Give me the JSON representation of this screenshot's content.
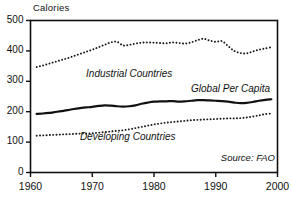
{
  "chart_data": {
    "type": "line",
    "title": "",
    "subtitle": "",
    "xlabel": "",
    "ylabel": "Calories",
    "xlim": [
      1960,
      2000
    ],
    "ylim": [
      0,
      500
    ],
    "grid": false,
    "legend_position": "inline-annotations",
    "source_note": "Source: FAO",
    "x_ticks": [
      "1960",
      "1970",
      "1980",
      "1990",
      "2000"
    ],
    "x_tick_values": [
      1960,
      1970,
      1980,
      1990,
      2000
    ],
    "y_ticks": [
      "0",
      "100",
      "200",
      "300",
      "400",
      "500"
    ],
    "y_tick_values": [
      0,
      100,
      200,
      300,
      400,
      500
    ],
    "x": [
      1961,
      1962,
      1963,
      1964,
      1965,
      1966,
      1967,
      1968,
      1969,
      1970,
      1971,
      1972,
      1973,
      1974,
      1975,
      1976,
      1977,
      1978,
      1979,
      1980,
      1981,
      1982,
      1983,
      1984,
      1985,
      1986,
      1987,
      1988,
      1989,
      1990,
      1991,
      1992,
      1993,
      1994,
      1995,
      1996,
      1997,
      1998,
      1999
    ],
    "series": [
      {
        "name": "Industrial Countries",
        "style": "dotted",
        "color": "#1a1a1a",
        "label_x": 1969,
        "label_y": 322,
        "values": [
          347,
          352,
          358,
          364,
          370,
          376,
          383,
          390,
          397,
          404,
          412,
          420,
          428,
          430,
          418,
          420,
          424,
          427,
          428,
          427,
          426,
          425,
          428,
          426,
          424,
          428,
          435,
          440,
          434,
          430,
          432,
          416,
          400,
          393,
          392,
          398,
          404,
          408,
          412
        ]
      },
      {
        "name": "Global Per Capita",
        "style": "solid",
        "color": "#111111",
        "label_x": 1986,
        "label_y": 272,
        "values": [
          193,
          194,
          196,
          199,
          202,
          205,
          209,
          212,
          214,
          216,
          219,
          221,
          220,
          218,
          217,
          218,
          221,
          226,
          230,
          233,
          234,
          234,
          235,
          233,
          234,
          236,
          238,
          238,
          237,
          236,
          235,
          233,
          230,
          228,
          229,
          232,
          236,
          239,
          241
        ]
      },
      {
        "name": "Developing Countries",
        "style": "dotted",
        "color": "#1a1a1a",
        "label_x": 1968,
        "label_y": 112,
        "values": [
          121,
          122,
          123,
          124,
          125,
          126,
          127,
          128,
          128,
          129,
          131,
          133,
          135,
          137,
          139,
          142,
          146,
          150,
          154,
          158,
          161,
          164,
          166,
          168,
          170,
          172,
          173,
          174,
          175,
          176,
          177,
          178,
          178,
          179,
          181,
          184,
          188,
          192,
          194
        ]
      }
    ]
  },
  "labels": {
    "y_axis_title": "Calories",
    "industrial": "Industrial Countries",
    "global": "Global Per Capita",
    "developing": "Developing Countries",
    "source": "Source: FAO"
  },
  "colors": {
    "line": "#111111",
    "axis": "#111111",
    "background": "#ffffff"
  }
}
